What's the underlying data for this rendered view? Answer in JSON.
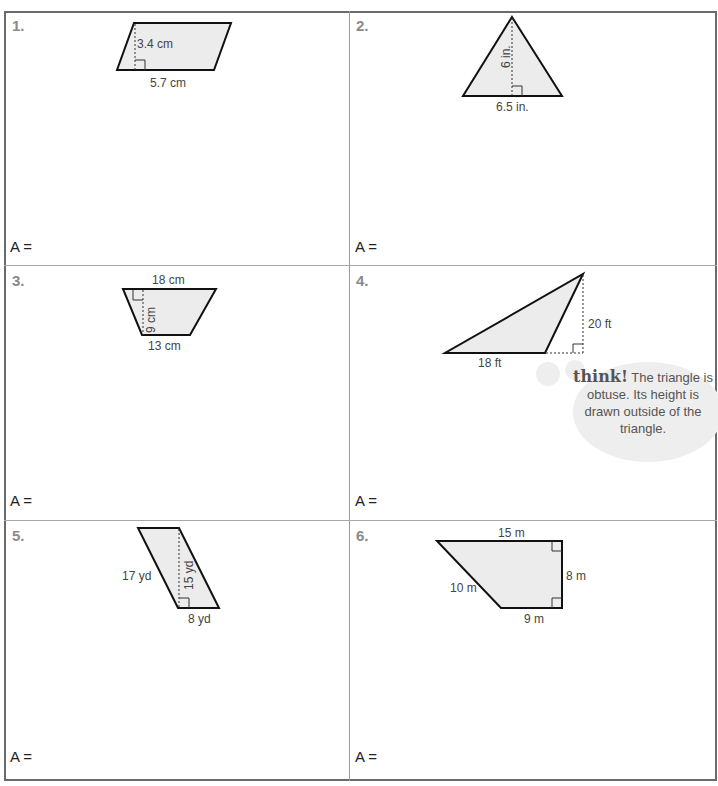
{
  "worksheet": {
    "problems": [
      {
        "number": "1.",
        "shape": "parallelogram",
        "labels": {
          "height": "3.4 cm",
          "base": "5.7 cm"
        },
        "answer_prompt": "A ="
      },
      {
        "number": "2.",
        "shape": "triangle",
        "labels": {
          "height": "6 in.",
          "base": "6.5 in."
        },
        "answer_prompt": "A ="
      },
      {
        "number": "3.",
        "shape": "trapezoid",
        "labels": {
          "top_base": "18 cm",
          "height": "9 cm",
          "bottom_base": "13 cm"
        },
        "answer_prompt": "A ="
      },
      {
        "number": "4.",
        "shape": "obtuse-triangle",
        "labels": {
          "base": "18 ft",
          "height": "20 ft"
        },
        "answer_prompt": "A ="
      },
      {
        "number": "5.",
        "shape": "parallelogram",
        "labels": {
          "side": "17 yd",
          "height": "15 yd",
          "base": "8 yd"
        },
        "answer_prompt": "A ="
      },
      {
        "number": "6.",
        "shape": "right-trapezoid",
        "labels": {
          "top_base": "15 m",
          "height": "8 m",
          "slant": "10 m",
          "bottom_base": "9 m"
        },
        "answer_prompt": "A ="
      }
    ],
    "think_bubble": {
      "keyword": "think!",
      "text": " The triangle is obtuse. Its height is drawn outside of the triangle."
    },
    "colors": {
      "shape_fill": "#ececec",
      "border": "#6a6a6a",
      "number": "#8a8a8a"
    }
  }
}
